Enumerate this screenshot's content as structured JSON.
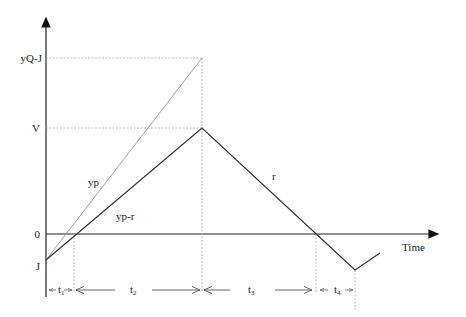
{
  "diagram": {
    "y_axis_labels": {
      "yqj": "yQ-J",
      "v": "V",
      "zero": "0",
      "j": "J"
    },
    "x_axis_label": "Time",
    "curve_labels": {
      "yp": "yp",
      "yp_minus_r": "yp-r",
      "r": "r"
    },
    "intervals": [
      {
        "base": "t",
        "sub": "1"
      },
      {
        "base": "t",
        "sub": "2"
      },
      {
        "base": "t",
        "sub": "3"
      },
      {
        "base": "t",
        "sub": "4"
      }
    ],
    "colors": {
      "axis": "#222222",
      "main_line": "#333333",
      "light_line": "#999999",
      "dashed": "#aaaaaa"
    }
  }
}
